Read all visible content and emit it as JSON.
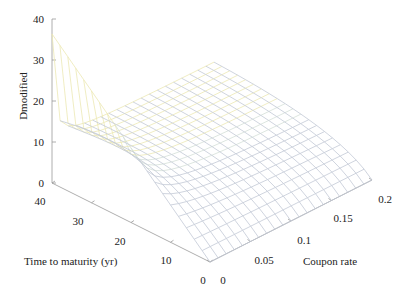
{
  "chart_data": {
    "type": "surface3d",
    "title": "",
    "zlabel": "Dmodified",
    "xlabel": "Time to maturity (yr)",
    "ylabel": "Coupon rate",
    "z_ticks": [
      "0",
      "10",
      "20",
      "30",
      "40"
    ],
    "t_ticks": [
      "0",
      "10",
      "20",
      "30",
      "40"
    ],
    "c_ticks": [
      "0",
      "0.05",
      "0.1",
      "0.15",
      "0.2"
    ],
    "zlim": [
      0,
      40
    ],
    "tlim": [
      0,
      40
    ],
    "clim": [
      0,
      0.2
    ],
    "yield_assumed": 0.1,
    "grid_T_steps": 20,
    "grid_c_steps": 20,
    "sample_values": [
      {
        "T": 40,
        "c": 0,
        "D": 36.4
      },
      {
        "T": 40,
        "c": 0.2,
        "D": 9.0
      },
      {
        "T": 10,
        "c": 0.1,
        "D": 6.1
      },
      {
        "T": 0,
        "c": 0,
        "D": 0
      }
    ]
  },
  "axes": {
    "z_label": "Dmodified",
    "t_label": "Time to maturity (yr)",
    "c_label": "Coupon rate"
  }
}
